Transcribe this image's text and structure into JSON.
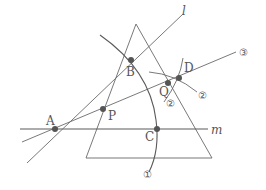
{
  "figure": {
    "type": "geometric-construction",
    "triangle": {
      "apex": [
        136,
        24
      ],
      "bottom_left": [
        86,
        158
      ],
      "bottom_right": [
        212,
        158
      ]
    },
    "lines": {
      "l": {
        "label": "l",
        "from": [
          20,
          163
        ],
        "to": [
          183,
          14
        ]
      },
      "m": {
        "label": "m",
        "from": [
          20,
          129
        ],
        "to": [
          208,
          129
        ]
      },
      "ray3": {
        "label": "③",
        "from": [
          22,
          143
        ],
        "to": [
          236,
          52
        ]
      }
    },
    "arcs": {
      "arc1": {
        "label": "①"
      },
      "arc2": {
        "label_a": "②",
        "label_b": "②"
      }
    },
    "points": {
      "A": {
        "label": "A",
        "pos": [
          55,
          129
        ]
      },
      "B": {
        "label": "B",
        "pos": [
          131,
          60
        ]
      },
      "P": {
        "label": "P",
        "pos": [
          103,
          109
        ]
      },
      "Q": {
        "label": "Q",
        "pos": [
          168,
          83
        ]
      },
      "D": {
        "label": "D",
        "pos": [
          179,
          78
        ]
      },
      "C": {
        "label": "C",
        "pos": [
          157,
          129
        ]
      }
    },
    "colors": {
      "line": "#6a6a6a",
      "point": "#555555",
      "text": "#555555"
    }
  }
}
